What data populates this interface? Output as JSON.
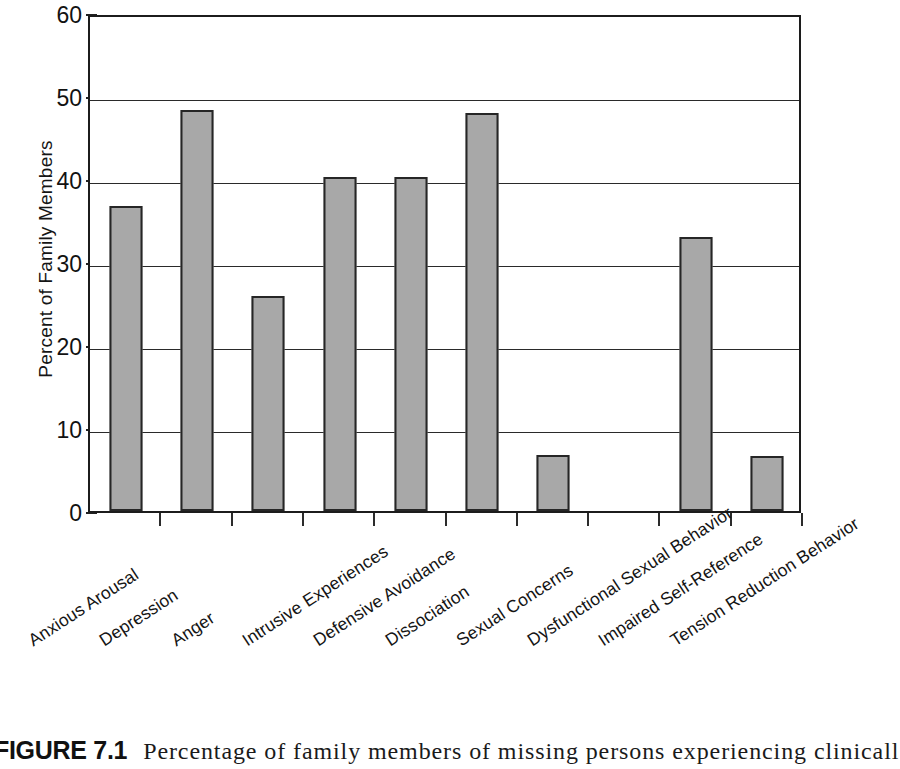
{
  "figure": {
    "caption_label": "FIGURE 7.1",
    "caption_text": "Percentage of family members of missing persons experiencing clinicall"
  },
  "chart_data": {
    "type": "bar",
    "title": "",
    "xlabel": "",
    "ylabel": "Percent of Family Members",
    "ylim": [
      0,
      60
    ],
    "ytick_labels": [
      "0",
      "10",
      "20",
      "30",
      "40",
      "50",
      "60"
    ],
    "ytick_values": [
      0,
      10,
      20,
      30,
      40,
      50,
      60
    ],
    "grid": true,
    "legend": "none",
    "bar_color": "#a8a8a8",
    "bar_edge_color": "#262626",
    "categories": [
      "Anxious Arousal",
      "Depression",
      "Anger",
      "Intrusive Experiences",
      "Defensive Avoidance",
      "Dissociation",
      "Sexual Concerns",
      "Dysfunctional Sexual Behavior",
      "Impaired Self-Reference",
      "Tension Reduction Behavior"
    ],
    "values": [
      36.8,
      48.3,
      25.9,
      40.3,
      40.2,
      48.0,
      6.8,
      0,
      33.0,
      6.6
    ]
  }
}
